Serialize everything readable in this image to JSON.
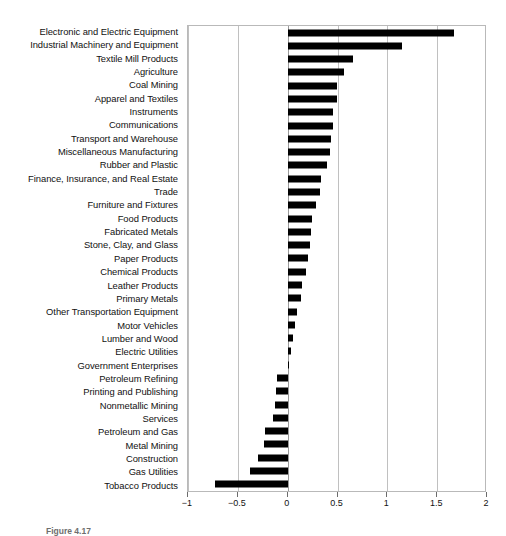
{
  "caption": "Figure 4.17",
  "chart_data": {
    "type": "bar",
    "orientation": "horizontal",
    "title": "",
    "subtitle": "",
    "xlabel": "",
    "ylabel": "",
    "xlim": [
      -1,
      2
    ],
    "ylim": null,
    "grid": true,
    "legend": null,
    "legend_position": "none",
    "bar_color": "#000000",
    "xticks": [
      -1,
      -0.5,
      0,
      0.5,
      1,
      1.5,
      2
    ],
    "xticklabels": [
      "−1",
      "−0.5",
      "0",
      "0.5",
      "1",
      "1.5",
      "2"
    ],
    "categories": [
      "Electronic and Electric Equipment",
      "Industrial Machinery and Equipment",
      "Textile Mill Products",
      "Agriculture",
      "Coal Mining",
      "Apparel and Textiles",
      "Instruments",
      "Communications",
      "Transport and Warehouse",
      "Miscellaneous Manufacturing",
      "Rubber and Plastic",
      "Finance, Insurance, and Real Estate",
      "Trade",
      "Furniture and Fixtures",
      "Food Products",
      "Fabricated Metals",
      "Stone, Clay, and Glass",
      "Paper Products",
      "Chemical Products",
      "Leather Products",
      "Primary Metals",
      "Other Transportation Equipment",
      "Motor Vehicles",
      "Lumber and Wood",
      "Electric Utilities",
      "Government Enterprises",
      "Petroleum Refining",
      "Printing and Publishing",
      "Nonmetallic Mining",
      "Services",
      "Petroleum and Gas",
      "Metal Mining",
      "Construction",
      "Gas Utilities",
      "Tobacco Products"
    ],
    "values": [
      1.67,
      1.15,
      0.66,
      0.57,
      0.5,
      0.5,
      0.45,
      0.45,
      0.43,
      0.42,
      0.39,
      0.33,
      0.32,
      0.28,
      0.24,
      0.23,
      0.22,
      0.2,
      0.18,
      0.14,
      0.13,
      0.09,
      0.07,
      0.05,
      0.03,
      0.01,
      -0.11,
      -0.12,
      -0.13,
      -0.15,
      -0.23,
      -0.24,
      -0.3,
      -0.38,
      -0.73
    ]
  }
}
